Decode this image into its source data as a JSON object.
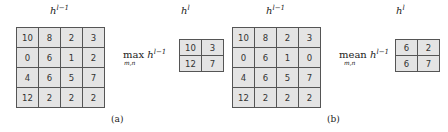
{
  "panels": [
    {
      "input_label": {
        "base": "h",
        "sup": "l−1"
      },
      "output_label": {
        "base": "h",
        "sup": "l"
      },
      "input_grid": [
        [
          "10",
          "8",
          "2",
          "3"
        ],
        [
          "0",
          "6",
          "1",
          "2"
        ],
        [
          "4",
          "6",
          "5",
          "7"
        ],
        [
          "12",
          "2",
          "2",
          "2"
        ]
      ],
      "operation": {
        "name": "max",
        "sub": "m,n",
        "base": "h",
        "sup": "l−1"
      },
      "output_grid": [
        [
          "10",
          "3"
        ],
        [
          "12",
          "7"
        ]
      ],
      "caption": "(a)"
    },
    {
      "input_label": {
        "base": "h",
        "sup": "l−1"
      },
      "output_label": {
        "base": "h",
        "sup": "l"
      },
      "input_grid": [
        [
          "10",
          "8",
          "2",
          "3"
        ],
        [
          "0",
          "6",
          "1",
          "0"
        ],
        [
          "4",
          "6",
          "5",
          "7"
        ],
        [
          "12",
          "2",
          "2",
          "2"
        ]
      ],
      "operation": {
        "name": "mean",
        "sub": "m,n",
        "base": "h",
        "sup": "l−1"
      },
      "output_grid": [
        [
          "6",
          "2"
        ],
        [
          "6",
          "7"
        ]
      ],
      "caption": "(b)"
    }
  ]
}
